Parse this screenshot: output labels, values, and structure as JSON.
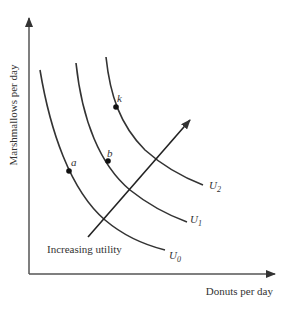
{
  "diagram": {
    "type": "indifference-map",
    "axes": {
      "x_label": "Donuts per day",
      "y_label": "Marshmallows per day"
    },
    "curves": [
      {
        "name": "U",
        "sub": "0",
        "point": "a"
      },
      {
        "name": "U",
        "sub": "1",
        "point": "b"
      },
      {
        "name": "U",
        "sub": "2",
        "point": "k"
      }
    ],
    "arrow_label": "Increasing utility",
    "colors": {
      "line": "#333333",
      "background": "#ffffff"
    }
  }
}
